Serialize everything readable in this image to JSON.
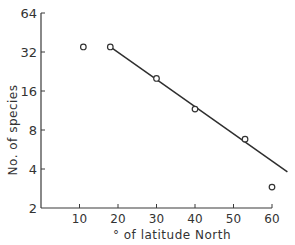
{
  "chart_data": {
    "type": "scatter",
    "title": "",
    "xlabel": "° of latitude North",
    "ylabel": "No. of species",
    "x_ticks": [
      10,
      20,
      30,
      40,
      50,
      60
    ],
    "x_tick_labels": [
      "10",
      "20",
      "30",
      "40",
      "50",
      "60"
    ],
    "y_ticks": [
      2,
      4,
      8,
      16,
      32,
      64
    ],
    "y_tick_labels": [
      "2",
      "4",
      "8",
      "16",
      "32",
      "64"
    ],
    "y_scale": "log2",
    "xlim": [
      0,
      63
    ],
    "ylim": [
      2,
      64
    ],
    "grid": false,
    "legend": null,
    "series": [
      {
        "name": "observed",
        "marker": "open-circle",
        "points": [
          {
            "x": 11,
            "y": 35
          },
          {
            "x": 18,
            "y": 35
          },
          {
            "x": 30,
            "y": 20
          },
          {
            "x": 40,
            "y": 11.6
          },
          {
            "x": 53,
            "y": 6.8
          },
          {
            "x": 60,
            "y": 2.9
          }
        ]
      }
    ],
    "fit_line": {
      "name": "regression",
      "from": {
        "x": 18,
        "y": 35
      },
      "to": {
        "x": 64,
        "y": 3.8
      }
    }
  }
}
